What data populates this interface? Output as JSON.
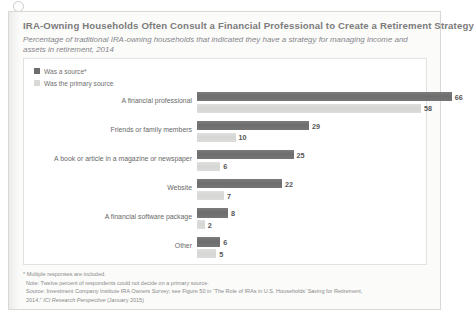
{
  "figure": {
    "title": "IRA-Owning Households Often Consult a Financial Professional to Create a Retirement Strategy",
    "subtitle": "Percentage of traditional IRA-owning households that indicated they have a strategy for managing income and assets in retirement, 2014"
  },
  "legend": {
    "items": [
      {
        "label": "Was a source*",
        "color": "#6d6d6d"
      },
      {
        "label": "Was the primary source",
        "color": "#d9d9d7"
      }
    ]
  },
  "footnotes": {
    "asterisk": "* Multiple responses are included.",
    "note": "Note: Twelve percent of respondents could not decide on a primary source.",
    "source_line1": "Source: Investment Company Institute IRA Owners Survey; see Figure 50 in “The Role of IRAs in U.S. Households’ Saving for Retirement,",
    "source_line2_prefix": "2014,” ",
    "source_line2_italic": "ICI Research Perspective",
    "source_line2_suffix": " (January 2015)"
  },
  "chart_data": {
    "type": "bar",
    "orientation": "horizontal",
    "title": "IRA-Owning Households Often Consult a Financial Professional to Create a Retirement Strategy",
    "subtitle": "Percentage of traditional IRA-owning households that indicated they have a strategy for managing income and assets in retirement, 2014",
    "xlabel": "",
    "ylabel": "",
    "xlim": [
      0,
      70
    ],
    "grid": false,
    "legend_position": "top-left",
    "categories": [
      "A financial professional",
      "Friends or family members",
      "A book or article in a magazine or newspaper",
      "Website",
      "A financial software package",
      "Other"
    ],
    "series": [
      {
        "name": "Was a source*",
        "color": "#6d6d6d",
        "values": [
          66,
          29,
          25,
          22,
          8,
          6
        ]
      },
      {
        "name": "Was the primary source",
        "color": "#d9d9d7",
        "values": [
          58,
          10,
          6,
          7,
          2,
          5
        ]
      }
    ]
  }
}
